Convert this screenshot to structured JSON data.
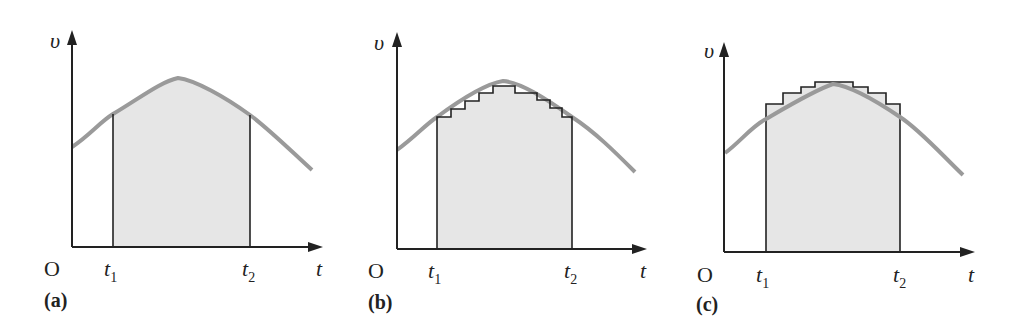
{
  "figure": {
    "panels": [
      {
        "id": "a",
        "caption": "(a)",
        "y_axis_label": "υ",
        "x_axis_label": "t",
        "origin_label": "O",
        "t1_label": "t",
        "t1_sub": "1",
        "t2_label": "t",
        "t2_sub": "2",
        "description": "Shaded area under velocity curve between t1 and t2"
      },
      {
        "id": "b",
        "caption": "(b)",
        "y_axis_label": "υ",
        "x_axis_label": "t",
        "origin_label": "O",
        "t1_label": "t",
        "t1_sub": "1",
        "t2_label": "t",
        "t2_sub": "2",
        "description": "Area approximated by rectangles lying under the curve (lower staircase)"
      },
      {
        "id": "c",
        "caption": "(c)",
        "y_axis_label": "υ",
        "x_axis_label": "t",
        "origin_label": "O",
        "t1_label": "t",
        "t1_sub": "1",
        "t2_label": "t",
        "t2_sub": "2",
        "description": "Area approximated by rectangles extending above the curve (upper staircase)"
      }
    ],
    "colors": {
      "axis": "#222222",
      "curve": "#9a9a9a",
      "fill": "#e6e6e6",
      "steps": "#222222"
    }
  }
}
